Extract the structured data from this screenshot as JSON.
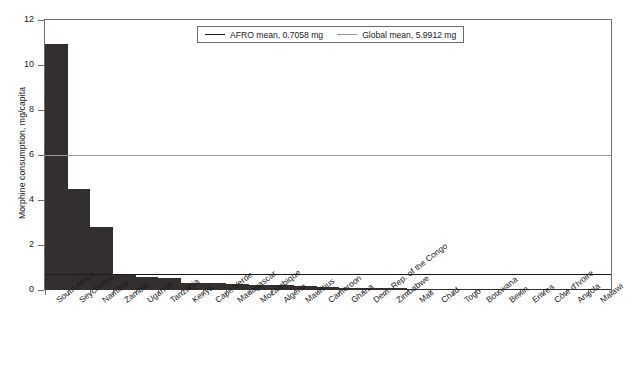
{
  "chart_data": {
    "type": "bar",
    "title": "",
    "xlabel": "",
    "ylabel": "Morphine consumption, mg/capita",
    "ylim": [
      0,
      12
    ],
    "yticks": [
      "0",
      "2",
      "4",
      "6",
      "8",
      "10",
      "12"
    ],
    "grid": false,
    "categories": [
      "South Africa",
      "Seychelles",
      "Namibia",
      "Zambia",
      "Uganda",
      "Tanzania",
      "Kenya",
      "Cape Verde",
      "Madagascar",
      "Mozambique",
      "Algeria",
      "Mauritius",
      "Cameroon",
      "Ghana",
      "Dem. Rep. of the Congo",
      "Zimbabwe",
      "Mali",
      "Chad",
      "Togo",
      "Botswana",
      "Benin",
      "Eritrea",
      "Côte d'Ivoire",
      "Angola",
      "Malawi"
    ],
    "values": [
      10.95,
      4.5,
      2.8,
      0.68,
      0.6,
      0.52,
      0.33,
      0.3,
      0.26,
      0.22,
      0.21,
      0.2,
      0.12,
      0.1,
      0.1,
      0.08,
      0.05,
      0.04,
      0.04,
      0.03,
      0.03,
      0.02,
      0.02,
      0.01,
      0.01
    ],
    "reference_lines": [
      {
        "name": "AFRO mean",
        "value": 0.7058,
        "label": "AFRO mean, 0.7058 mg",
        "color": "#1a1a1a"
      },
      {
        "name": "Global mean",
        "value": 5.9912,
        "label": "Global mean, 5.9912 mg",
        "color": "#9a9a9a"
      }
    ],
    "legend_position": "top-center",
    "bar_color": "#332f2e"
  },
  "legend": {
    "entries": [
      {
        "label": "AFRO mean, 0.7058 mg"
      },
      {
        "label": "Global mean, 5.9912 mg"
      }
    ]
  }
}
